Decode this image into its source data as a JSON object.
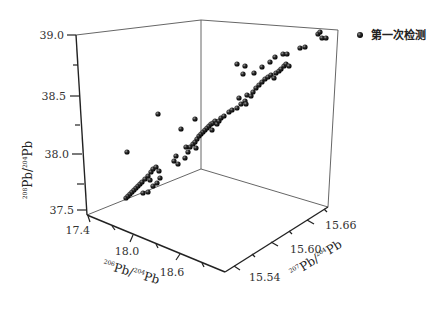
{
  "chart_data": {
    "type": "scatter3d",
    "title": "",
    "xlabel": "206Pb/204Pb",
    "ylabel": "207Pb/204Pb",
    "zlabel": "208Pb/204Pb",
    "axes": {
      "x": {
        "label_main": "Pb/",
        "label_sup1": "206",
        "label_sup2": "204",
        "label_tail": "Pb",
        "ticks": [
          "17.4",
          "18.0",
          "18.6"
        ],
        "range": [
          17.4,
          19.0
        ]
      },
      "y": {
        "label_main": "Pb/",
        "label_sup1": "207",
        "label_sup2": "204",
        "label_tail": "Pb",
        "ticks": [
          "15.54",
          "15.60",
          "15.66"
        ],
        "range": [
          15.5,
          15.7
        ]
      },
      "z": {
        "label_main": "Pb/",
        "label_sup1": "208",
        "label_sup2": "204",
        "label_tail": "Pb",
        "ticks": [
          "37.5",
          "38.0",
          "38.5",
          "39.0"
        ],
        "range": [
          37.5,
          39.0
        ]
      }
    },
    "grid": false,
    "legend": {
      "position": "top-right",
      "entries": [
        "第一次检测"
      ]
    },
    "series": [
      {
        "name": "第一次检测",
        "marker": "sphere",
        "color": "#1a1a1a",
        "screen_points": [
          [
            126,
            198
          ],
          [
            128,
            196
          ],
          [
            130,
            194
          ],
          [
            132,
            192
          ],
          [
            134,
            190
          ],
          [
            136,
            188
          ],
          [
            138,
            186
          ],
          [
            140,
            184
          ],
          [
            142,
            182
          ],
          [
            145,
            179
          ],
          [
            148,
            176
          ],
          [
            151,
            172
          ],
          [
            153,
            169
          ],
          [
            156,
            167
          ],
          [
            159,
            171
          ],
          [
            160,
            178
          ],
          [
            143,
            193
          ],
          [
            148,
            192
          ],
          [
            153,
            186
          ],
          [
            157,
            183
          ],
          [
            150,
            180
          ],
          [
            127,
            152
          ],
          [
            158,
            114
          ],
          [
            181,
            129
          ],
          [
            174,
            161
          ],
          [
            176,
            156
          ],
          [
            178,
            164
          ],
          [
            185,
            158
          ],
          [
            188,
            152
          ],
          [
            190,
            147
          ],
          [
            193,
            144
          ],
          [
            195,
            142
          ],
          [
            197,
            139
          ],
          [
            199,
            136
          ],
          [
            201,
            134
          ],
          [
            203,
            132
          ],
          [
            205,
            130
          ],
          [
            207,
            128
          ],
          [
            209,
            126
          ],
          [
            211,
            124
          ],
          [
            213,
            123
          ],
          [
            215,
            121
          ],
          [
            217,
            124
          ],
          [
            219,
            121
          ],
          [
            221,
            118
          ],
          [
            196,
            148
          ],
          [
            186,
            147
          ],
          [
            195,
            119
          ],
          [
            212,
            130
          ],
          [
            224,
            116
          ],
          [
            237,
            108
          ],
          [
            241,
            104
          ],
          [
            245,
            101
          ],
          [
            239,
            98
          ],
          [
            247,
            95
          ],
          [
            251,
            96
          ],
          [
            246,
            104
          ],
          [
            253,
            92
          ],
          [
            256,
            88
          ],
          [
            259,
            85
          ],
          [
            262,
            82
          ],
          [
            265,
            79
          ],
          [
            268,
            77
          ],
          [
            271,
            75
          ],
          [
            274,
            78
          ],
          [
            276,
            73
          ],
          [
            279,
            71
          ],
          [
            281,
            69
          ],
          [
            284,
            66
          ],
          [
            286,
            64
          ],
          [
            289,
            66
          ],
          [
            237,
            64
          ],
          [
            245,
            66
          ],
          [
            243,
            74
          ],
          [
            254,
            73
          ],
          [
            262,
            67
          ],
          [
            270,
            62
          ],
          [
            275,
            57
          ],
          [
            283,
            54
          ],
          [
            287,
            54
          ],
          [
            300,
            48
          ],
          [
            305,
            47
          ],
          [
            318,
            34
          ],
          [
            320,
            32
          ],
          [
            322,
            38
          ],
          [
            326,
            38
          ],
          [
            229,
            112
          ],
          [
            232,
            110
          ]
        ]
      }
    ]
  },
  "legend": {
    "label": "第一次检测"
  },
  "z_ticks": [
    "39.0",
    "38.5",
    "38.0",
    "37.5"
  ],
  "x_ticks": [
    "17.4",
    "18.0",
    "18.6"
  ],
  "y_ticks": [
    "15.54",
    "15.60",
    "15.66"
  ],
  "z_title": {
    "sup1": "208",
    "main": "Pb/",
    "sup2": "204",
    "tail": "Pb"
  },
  "x_title": {
    "sup1": "206",
    "main": "Pb/",
    "sup2": "204",
    "tail": "Pb"
  },
  "y_title": {
    "sup1": "207",
    "main": "Pb/",
    "sup2": "204",
    "tail": "Pb"
  }
}
